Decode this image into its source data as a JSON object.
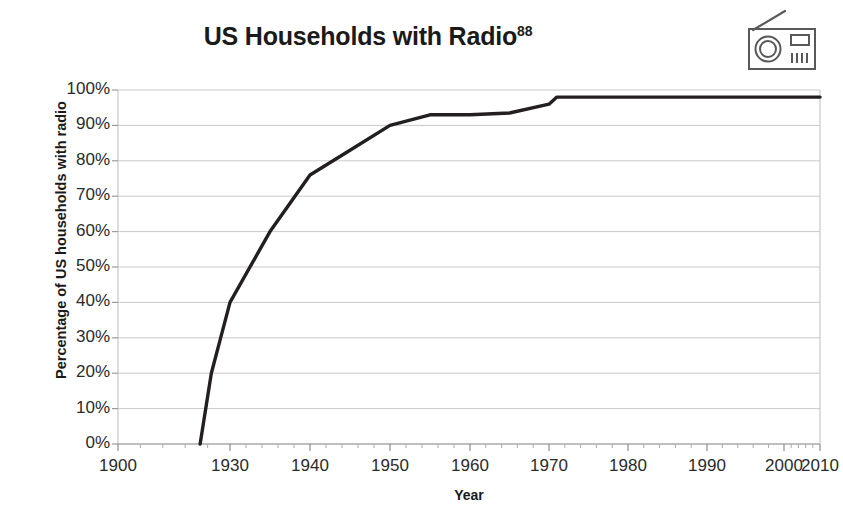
{
  "figure": {
    "title": "US Households with Radio",
    "title_superscript": "88",
    "icon": "radio-icon",
    "background_color": "#ffffff",
    "line_color": "#231f20",
    "grid_color": "#c9c9c9",
    "text_color": "#231f20"
  },
  "chart_data": {
    "type": "line",
    "title": "US Households with Radio",
    "xlabel": "Year",
    "ylabel": "Percentage of US households with radio",
    "xlim": [
      1900,
      2010
    ],
    "ylim": [
      0,
      100
    ],
    "grid": true,
    "legend": "none",
    "y_tick_labels": [
      "100%",
      "90%",
      "80%",
      "70%",
      "60%",
      "50%",
      "40%",
      "30%",
      "20%",
      "10%",
      "0%"
    ],
    "y_tick_values": [
      100,
      90,
      80,
      70,
      60,
      50,
      40,
      30,
      20,
      10,
      0
    ],
    "x_tick_labels": [
      "1900",
      "1930",
      "1940",
      "1950",
      "1960",
      "1970",
      "1980",
      "1990",
      "2000",
      "2010"
    ],
    "x_tick_values": [
      1900,
      1930,
      1940,
      1950,
      1960,
      1970,
      1980,
      1990,
      2000,
      2010
    ],
    "series": [
      {
        "name": "US households with radio",
        "color": "#231f20",
        "x": [
          1922,
          1925,
          1927,
          1930,
          1935,
          1940,
          1945,
          1950,
          1955,
          1960,
          1965,
          1970,
          1971,
          1980,
          1990,
          2000,
          2010
        ],
        "values": [
          0,
          20,
          28,
          40,
          60,
          76,
          83,
          90,
          93,
          93,
          93.5,
          96,
          98,
          98,
          98,
          98,
          98
        ]
      }
    ]
  }
}
